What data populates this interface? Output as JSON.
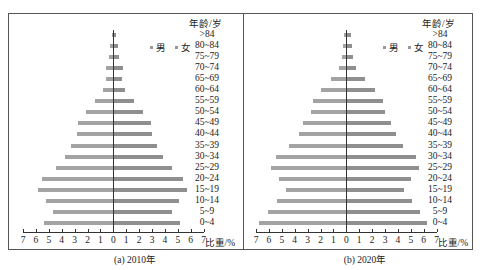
{
  "chart_data": [
    {
      "type": "bar",
      "subtype": "population-pyramid",
      "title": "(a) 2010年",
      "caption": "(a) 2010年",
      "xlabel": "比重/%",
      "ylabel": "年龄/岁",
      "xlim": [
        -7,
        7
      ],
      "xticks": [
        "7",
        "6",
        "5",
        "4",
        "3",
        "2",
        "1",
        "0",
        "1",
        "2",
        "3",
        "4",
        "5",
        "6",
        "7"
      ],
      "legend": [
        "男",
        "女"
      ],
      "legend_position": "upper-right",
      "grid": false,
      "categories": [
        ">84",
        "80~84",
        "75~79",
        "70~74",
        "65~69",
        "60~64",
        "55~59",
        "50~54",
        "45~49",
        "40~44",
        "35~39",
        "30~34",
        "25~29",
        "20~24",
        "15~19",
        "10~14",
        "5~9",
        "0~4"
      ],
      "series": [
        {
          "name": "男",
          "side": "left",
          "values": [
            0.1,
            0.25,
            0.35,
            0.6,
            0.6,
            0.8,
            1.45,
            2.15,
            2.75,
            2.8,
            3.3,
            3.75,
            4.45,
            5.5,
            5.8,
            5.25,
            4.65,
            5.4
          ]
        },
        {
          "name": "女",
          "side": "right",
          "values": [
            0.15,
            0.25,
            0.4,
            0.65,
            0.6,
            0.85,
            1.55,
            2.25,
            2.85,
            2.95,
            3.3,
            3.75,
            4.45,
            5.35,
            5.65,
            5.0,
            4.45,
            5.1
          ]
        }
      ]
    },
    {
      "type": "bar",
      "subtype": "population-pyramid",
      "title": "(b) 2020年",
      "caption": "(b) 2020年",
      "xlabel": "比重/%",
      "ylabel": "年龄/岁",
      "xlim": [
        -7,
        7
      ],
      "xticks": [
        "7",
        "6",
        "5",
        "4",
        "3",
        "2",
        "1",
        "0",
        "1",
        "2",
        "3",
        "4",
        "5",
        "6",
        "7"
      ],
      "legend": [
        "男",
        "女"
      ],
      "legend_position": "upper-right",
      "grid": false,
      "categories": [
        ">84",
        "80~84",
        "75~79",
        "70~74",
        "65~69",
        "60~64",
        "55~59",
        "50~54",
        "45~49",
        "40~44",
        "35~39",
        "30~34",
        "25~29",
        "20~24",
        "15~19",
        "10~14",
        "5~9",
        "0~4"
      ],
      "series": [
        {
          "name": "男",
          "side": "left",
          "values": [
            0.15,
            0.25,
            0.35,
            0.55,
            1.2,
            1.95,
            2.6,
            2.75,
            3.35,
            3.7,
            4.45,
            5.45,
            5.8,
            5.25,
            4.65,
            5.4,
            6.1,
            6.8
          ]
        },
        {
          "name": "女",
          "side": "right",
          "values": [
            0.3,
            0.35,
            0.45,
            0.65,
            1.35,
            2.15,
            2.8,
            2.95,
            3.35,
            3.75,
            4.35,
            5.3,
            5.55,
            4.95,
            4.4,
            5.05,
            5.6,
            6.2
          ]
        }
      ]
    }
  ],
  "panels": [
    {
      "caption": "(a)  2010年",
      "age_header": "年龄/岁",
      "unit_label": "比重/%",
      "legend_male": "男",
      "legend_female": "女"
    },
    {
      "caption": "(b)  2020年",
      "age_header": "年龄/岁",
      "unit_label": "比重/%",
      "legend_male": "男",
      "legend_female": "女"
    }
  ]
}
